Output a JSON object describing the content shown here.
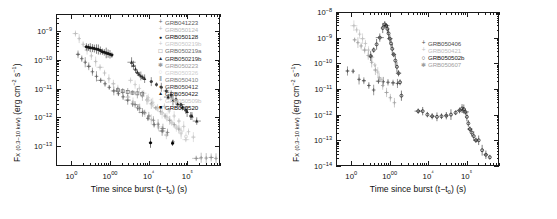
{
  "figure": {
    "panels": [
      {
        "id": "left",
        "axis": {
          "xlabel_pre": "Time since burst (t−t",
          "xlabel_sub": "0",
          "xlabel_post": ") (s)",
          "ylabel_main": "F",
          "ylabel_sub": "X",
          "ylabel_band": "(0.3–10 keV)",
          "ylabel_units": "(erg cm−2 s−1)",
          "xticks": [
            "100",
            "1000",
            "10⁴",
            "10⁵"
          ],
          "yticks": [
            "10−9",
            "10−10",
            "10−11",
            "10−12",
            "10−13"
          ],
          "xlim": [
            40,
            700000
          ],
          "ylim": [
            2e-14,
            4e-09
          ]
        },
        "legend": [
          {
            "label": "GRB041223",
            "marker": "plus",
            "color": "#5a5a5a"
          },
          {
            "label": "GRB050124",
            "marker": "plus",
            "color": "#b8b8b8"
          },
          {
            "label": "GRB050128",
            "marker": "circle-filled",
            "color": "#161616"
          },
          {
            "label": "GRB050219b",
            "marker": "plus",
            "color": "#c9c9c9"
          },
          {
            "label": "GRB050219a",
            "marker": "square-open",
            "color": "#6e6e6e"
          },
          {
            "label": "GRB050219b",
            "marker": "triangle-filled",
            "color": "#2d2d2d"
          },
          {
            "label": "GRB050223",
            "marker": "asterisk",
            "color": "#9a9a9a"
          },
          {
            "label": "GRB050326",
            "marker": "circle-open",
            "color": "#cfcfcf"
          },
          {
            "label": "GRB050410",
            "marker": "bars",
            "color": "#7d7d7d"
          },
          {
            "label": "GRB050412",
            "marker": "circle-filled",
            "color": "#3d3d3d"
          },
          {
            "label": "GRB050422",
            "marker": "triangle-filled",
            "color": "#222222"
          },
          {
            "label": "GRB050509b",
            "marker": "plus",
            "color": "#c4c4c4"
          },
          {
            "label": "GRB060520",
            "marker": "square-filled",
            "color": "#000000"
          }
        ]
      },
      {
        "id": "right",
        "axis": {
          "xlabel_pre": "Time since burst (t−t",
          "xlabel_sub": "0",
          "xlabel_post": ") (s)",
          "ylabel_main": "F",
          "ylabel_sub": "X",
          "ylabel_band": "(0.3–10 keV)",
          "ylabel_units": "(erg cm−2 s−1)",
          "xticks": [
            "100",
            "1000",
            "10⁴",
            "10⁵"
          ],
          "yticks": [
            "10−8",
            "10−9",
            "10−10",
            "10−11",
            "10−12",
            "10−13",
            "10−14"
          ],
          "xlim": [
            40,
            700000
          ],
          "ylim": [
            1e-14,
            1e-08
          ]
        },
        "legend": [
          {
            "label": "GRB050406",
            "marker": "plus",
            "color": "#4a4a4a"
          },
          {
            "label": "GRB050421",
            "marker": "plus",
            "color": "#bdbdbd"
          },
          {
            "label": "GRB050502b",
            "marker": "circle-open",
            "color": "#141414"
          },
          {
            "label": "GRB050607",
            "marker": "asterisk",
            "color": "#9e9e9e"
          }
        ]
      }
    ]
  },
  "chart_data": [
    {
      "type": "scatter",
      "panel": "left",
      "title": "",
      "xlabel": "Time since burst (t-t0) (s)",
      "ylabel": "F_X (0.3-10 keV) (erg cm^-2 s^-1)",
      "xscale": "log",
      "yscale": "log",
      "xlim": [
        40,
        700000
      ],
      "ylim": [
        2e-14,
        4e-09
      ],
      "grid": false,
      "legend_position": "upper-right-inside",
      "series": [
        {
          "name": "GRB041223",
          "color": "#5a5a5a",
          "marker": "plus",
          "x": [
            140,
            175,
            215,
            265,
            330,
            420,
            540,
            700,
            900,
            1180,
            1550,
            2050,
            2700,
            3600,
            4900,
            6500,
            9000,
            13000,
            21000,
            40000
          ],
          "y": [
            1.7e-10,
            1.2e-10,
            9e-11,
            6.5e-11,
            4.2e-11,
            2.9e-11,
            2.1e-11,
            1.6e-11,
            1.2e-11,
            9e-12,
            7.2e-12,
            5.6e-12,
            4.3e-12,
            3.2e-12,
            2.3e-12,
            1.6e-12,
            1e-12,
            6e-13,
            3.6e-13,
            1.5e-13
          ]
        },
        {
          "name": "GRB050124",
          "color": "#b8b8b8",
          "marker": "plus",
          "x": [
            120,
            150,
            190,
            240,
            310,
            400,
            520,
            680,
            880,
            1150,
            1500,
            2000,
            2700,
            3700,
            5200,
            7500,
            11000,
            17000,
            27000
          ],
          "y": [
            9e-10,
            6e-10,
            3.8e-10,
            2.4e-10,
            1.5e-10,
            9.5e-11,
            6e-11,
            3.8e-11,
            2.4e-11,
            1.6e-11,
            1.1e-11,
            8e-12,
            5.5e-12,
            3.7e-12,
            2.4e-12,
            1.5e-12,
            9e-13,
            5e-13,
            2.6e-13
          ]
        },
        {
          "name": "GRB050128",
          "color": "#161616",
          "marker": "circle-filled",
          "x": [
            230,
            260,
            290,
            330,
            370,
            420,
            470,
            530,
            600,
            670,
            750,
            840,
            940,
            1050
          ],
          "y": [
            3.1e-10,
            3e-10,
            2.9e-10,
            2.8e-10,
            2.7e-10,
            2.6e-10,
            2.5e-10,
            2.3e-10,
            2.1e-10,
            2e-10,
            1.9e-10,
            1.8e-10,
            1.7e-10,
            1.6e-10
          ]
        },
        {
          "name": "GRB050219b",
          "color": "#c9c9c9",
          "marker": "plus",
          "x": [
            3200,
            4200,
            5400,
            7000,
            9200,
            12000,
            16000,
            21000,
            28000,
            37000,
            49000,
            65000,
            86000
          ],
          "y": [
            2.1e-11,
            1.5e-11,
            1.1e-11,
            7.5e-12,
            5.2e-12,
            3.6e-12,
            2.4e-12,
            1.6e-12,
            1.1e-12,
            7e-13,
            4.5e-13,
            2.9e-13,
            1.8e-13
          ]
        },
        {
          "name": "GRB050219a",
          "color": "#6e6e6e",
          "marker": "square-open",
          "x": [
            1500,
            2000,
            2700,
            3600,
            4800,
            6400
          ],
          "y": [
            9.5e-12,
            8.8e-12,
            8.2e-12,
            7.8e-12,
            7.4e-12,
            7e-12
          ]
        },
        {
          "name": "GRB050219b-t",
          "color": "#2d2d2d",
          "marker": "triangle-filled",
          "x": [
            3400,
            3800,
            4300,
            4800,
            5300,
            5900,
            6600,
            7400
          ],
          "y": [
            9e-11,
            7e-11,
            5.2e-11,
            4e-11,
            3.4e-11,
            3e-11,
            2.7e-11,
            2.4e-11
          ]
        },
        {
          "name": "GRB050223",
          "color": "#9a9a9a",
          "marker": "asterisk",
          "x": [
            6500,
            8500,
            11000,
            14500,
            19000,
            25000,
            33000,
            43000,
            57000
          ],
          "y": [
            6e-12,
            4.4e-12,
            3.2e-12,
            2.3e-12,
            1.7e-12,
            1.2e-12,
            8.5e-13,
            6e-13,
            4.2e-13
          ]
        },
        {
          "name": "GRB050326",
          "color": "#cfcfcf",
          "marker": "circle-open",
          "x": [
            9000,
            12000,
            16000,
            21000,
            28000,
            37000,
            49000,
            65000,
            87000
          ],
          "y": [
            4.2e-12,
            3e-12,
            2.1e-12,
            1.5e-12,
            1e-12,
            7.2e-13,
            5e-13,
            3.4e-13,
            2.3e-13
          ]
        },
        {
          "name": "GRB050410",
          "color": "#7d7d7d",
          "marker": "bars",
          "x": [
            4200,
            5500,
            7200,
            9500,
            12500,
            16500,
            22000,
            29000
          ],
          "y": [
            3e-12,
            2.2e-12,
            1.6e-12,
            1.2e-12,
            8.5e-13,
            6.2e-13,
            4.4e-13,
            3.2e-13
          ]
        },
        {
          "name": "GRB050412",
          "color": "#3d3d3d",
          "marker": "circle-filled",
          "x": [
            11000,
            15000,
            20000,
            27000,
            36000,
            48000,
            64000,
            86000,
            115000
          ],
          "y": [
            1.9e-11,
            1.5e-11,
            1.2e-11,
            9e-12,
            6.5e-12,
            4.5e-12,
            3e-12,
            1.9e-12,
            1.2e-12
          ]
        },
        {
          "name": "GRB050422",
          "color": "#222222",
          "marker": "triangle-filled",
          "x": [
            30000,
            40000,
            53000,
            70000,
            93000,
            124000,
            165000
          ],
          "y": [
            5.5e-12,
            4.2e-12,
            3.2e-12,
            2.4e-12,
            1.7e-12,
            1.2e-12,
            8e-13
          ]
        },
        {
          "name": "GRB050509b",
          "color": "#c4c4c4",
          "marker": "plus",
          "x": [
            24000,
            32000,
            43000,
            57000,
            76000,
            101000,
            135000
          ],
          "y": [
            2.6e-12,
            1.8e-12,
            1.2e-12,
            8e-13,
            5.2e-13,
            3.4e-13,
            2.2e-13
          ]
        },
        {
          "name": "GRB060520",
          "color": "#000000",
          "marker": "square-filled",
          "x": [
            10500,
            39000
          ],
          "y": [
            1.4e-13,
            1.35e-13
          ]
        },
        {
          "name": "faint-late-tail",
          "color": "#8a8a8a",
          "marker": "plus",
          "x": [
            160000,
            215000,
            290000,
            390000,
            520000
          ],
          "y": [
            4e-14,
            4.2e-14,
            4.1e-14,
            4.3e-14,
            4e-14
          ]
        }
      ]
    },
    {
      "type": "scatter",
      "panel": "right",
      "title": "",
      "xlabel": "Time since burst (t-t0) (s)",
      "ylabel": "F_X (0.3-10 keV) (erg cm^-2 s^-1)",
      "xscale": "log",
      "yscale": "log",
      "xlim": [
        40,
        700000
      ],
      "ylim": [
        1e-14,
        1e-08
      ],
      "grid": false,
      "legend_position": "upper-right-inside",
      "series": [
        {
          "name": "GRB050406",
          "color": "#4a4a4a",
          "marker": "plus",
          "x": [
            75,
            105,
            150,
            200,
            270,
            360,
            480,
            640,
            850,
            1150,
            1500
          ],
          "y": [
            5.5e-11,
            5.4e-11,
            2.6e-11,
            2.3e-11,
            1.5e-11,
            1e-11,
            2.2e-11,
            2.1e-11,
            2e-11,
            1.9e-11,
            1.8e-11
          ]
        },
        {
          "name": "GRB050421",
          "color": "#bdbdbd",
          "marker": "plus",
          "x": [
            110,
            130,
            155,
            185,
            220,
            265,
            320,
            385,
            460,
            560
          ],
          "y": [
            3.2e-09,
            2.2e-09,
            1.5e-09,
            1e-09,
            6.5e-10,
            3.6e-10,
            1.9e-10,
            9.5e-11,
            5e-11,
            2.6e-11
          ]
        },
        {
          "name": "GRB050502b",
          "color": "#141414",
          "marker": "circle-open",
          "x": [
            300,
            360,
            430,
            520,
            620,
            700,
            760,
            820,
            880,
            950,
            1020,
            1100,
            1200,
            1320,
            1450,
            1600,
            1750,
            1900,
            5200,
            6800,
            9000,
            12000,
            16000,
            21000,
            28000,
            37000,
            49000,
            62000,
            72000,
            80000,
            88000,
            96000,
            105000,
            115000,
            128000,
            145000,
            165000,
            195000,
            240000,
            300000,
            380000
          ],
          "y": [
            2.1e-10,
            3.6e-10,
            6e-10,
            1.1e-09,
            2.6e-09,
            3.6e-09,
            3.2e-09,
            2.4e-09,
            1.6e-09,
            1e-09,
            6.5e-10,
            4e-10,
            2.4e-10,
            1.4e-10,
            8e-11,
            4.5e-11,
            2e-11,
            6e-12,
            1.5e-12,
            1.5e-12,
            1.1e-12,
            9.5e-13,
            9e-13,
            9.5e-13,
            1e-12,
            1.1e-12,
            1.3e-12,
            1.6e-12,
            1.9e-12,
            1.8e-12,
            1.4e-12,
            9e-13,
            5e-13,
            3e-13,
            2.2e-13,
            1.6e-13,
            1.1e-13,
            1.1e-13,
            4.5e-14,
            3e-14,
            2.4e-14
          ]
        },
        {
          "name": "GRB050607",
          "color": "#9e9e9e",
          "marker": "asterisk",
          "x": [
            115,
            140,
            170,
            210,
            260,
            320,
            400,
            500,
            620,
            780,
            980,
            1250
          ],
          "y": [
            9e-10,
            7e-10,
            5.2e-10,
            3.6e-10,
            2.2e-10,
            1.2e-10,
            6e-11,
            3e-11,
            1.5e-11,
            8e-12,
            5e-12,
            3.2e-12
          ]
        }
      ]
    }
  ]
}
